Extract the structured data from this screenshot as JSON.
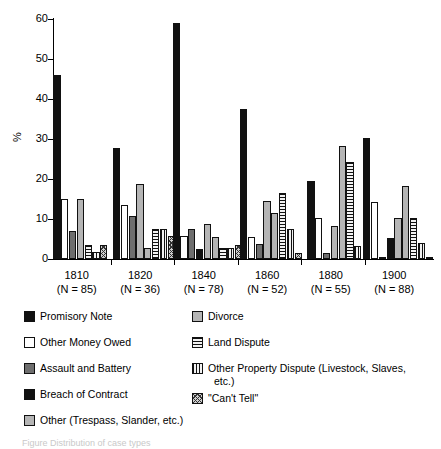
{
  "chart_data": {
    "type": "bar",
    "title": "",
    "xlabel": "",
    "ylabel": "%",
    "ylim": [
      0,
      60
    ],
    "yticks": [
      0,
      10,
      20,
      30,
      40,
      50,
      60
    ],
    "grid": false,
    "legend_position": "below",
    "categories": [
      "1810",
      "1820",
      "1840",
      "1860",
      "1880",
      "1900"
    ],
    "category_sublabels": [
      "(N = 85)",
      "(N = 36)",
      "(N = 78)",
      "(N = 52)",
      "(N = 55)",
      "(N = 88)"
    ],
    "series": [
      {
        "name": "Promisory Note",
        "fill": "f-black",
        "values": [
          45.9,
          27.8,
          59.0,
          37.5,
          19.4,
          30.3
        ]
      },
      {
        "name": "Other Money Owed",
        "fill": "f-white",
        "values": [
          14.9,
          13.6,
          5.7,
          5.4,
          10.3,
          14.3
        ]
      },
      {
        "name": "Assault and Battery",
        "fill": "f-dgray",
        "values": [
          6.9,
          10.8,
          7.5,
          3.8,
          1.5,
          0.5
        ]
      },
      {
        "name": "Breach of Contract",
        "fill": "f-black",
        "values": [
          0,
          0,
          2.6,
          0,
          0,
          5.3
        ]
      },
      {
        "name": "Other (Trespass, Slander, etc.)",
        "fill": "f-lgray",
        "values": [
          14.9,
          18.8,
          8.7,
          14.4,
          8.3,
          10.2
        ]
      },
      {
        "name": "Divorce",
        "fill": "f-lgray",
        "values": [
          0,
          2.8,
          5.6,
          11.4,
          28.3,
          18.3
        ]
      },
      {
        "name": "Land Dispute",
        "fill": "f-hlines",
        "values": [
          3.6,
          7.5,
          2.7,
          16.4,
          24.3,
          10.2
        ]
      },
      {
        "name": "Other Property Dispute (Livestock, Slaves, etc.)",
        "fill": "f-vlines",
        "values": [
          1.8,
          7.5,
          2.7,
          7.4,
          3.3,
          4.0
        ]
      },
      {
        "name": "\"Can't Tell\"",
        "fill": "f-check",
        "values": [
          3.6,
          5.8,
          3.5,
          1.5,
          0,
          0.5
        ]
      }
    ]
  },
  "legend": {
    "left": [
      {
        "label": "Promisory Note",
        "fill": "f-black"
      },
      {
        "label": "Other Money Owed",
        "fill": "f-white"
      },
      {
        "label": "Assault and Battery",
        "fill": "f-dgray"
      },
      {
        "label": "Breach of Contract",
        "fill": "f-black"
      },
      {
        "label": "Other (Trespass, Slander, etc.)",
        "fill": "f-lgray"
      }
    ],
    "right": [
      {
        "label": "Divorce",
        "fill": "f-lgray",
        "cont": ""
      },
      {
        "label": "Land Dispute",
        "fill": "f-hlines",
        "cont": ""
      },
      {
        "label": "Other Property Dispute (Livestock, Slaves,",
        "fill": "f-vlines",
        "cont": "etc.)"
      },
      {
        "label": "\"Can't Tell\"",
        "fill": "f-check",
        "cont": ""
      }
    ]
  },
  "caption": {
    "text": "Figure    Distribution of case types"
  },
  "colors": {
    "ink": "#111111",
    "paper": "#ffffff",
    "dark_gray": "#6e6e6e",
    "light_gray": "#b5b5b5"
  }
}
